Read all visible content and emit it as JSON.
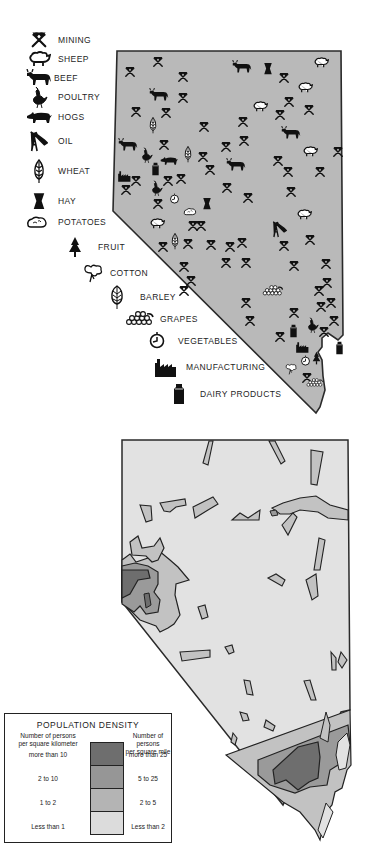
{
  "products_map": {
    "fill_color": "#b9b9b9",
    "legend": [
      {
        "icon": "mining-icon",
        "label": "MINING"
      },
      {
        "icon": "sheep-icon",
        "label": "SHEEP"
      },
      {
        "icon": "beef-icon",
        "label": "BEEF"
      },
      {
        "icon": "poultry-icon",
        "label": "POULTRY"
      },
      {
        "icon": "hogs-icon",
        "label": "HOGS"
      },
      {
        "icon": "oil-icon",
        "label": "OIL"
      },
      {
        "icon": "wheat-icon",
        "label": "WHEAT"
      },
      {
        "icon": "hay-icon",
        "label": "HAY"
      },
      {
        "icon": "potatoes-icon",
        "label": "POTATOES"
      },
      {
        "icon": "fruit-icon",
        "label": "FRUIT"
      },
      {
        "icon": "cotton-icon",
        "label": "COTTON"
      },
      {
        "icon": "barley-icon",
        "label": "BARLEY"
      },
      {
        "icon": "grapes-icon",
        "label": "GRAPES"
      },
      {
        "icon": "vegetables-icon",
        "label": "VEGETABLES"
      },
      {
        "icon": "manufacturing-icon",
        "label": "MANUFACTURING"
      },
      {
        "icon": "dairy-icon",
        "label": "DAIRY PRODUCTS"
      }
    ]
  },
  "population_map": {
    "legend": {
      "title": "POPULATION DENSITY",
      "left_header_line1": "Number of persons",
      "left_header_line2": "per square kilometer",
      "right_header_line1": "Number of persons",
      "right_header_line2": "per square mile",
      "classes": [
        {
          "km": "more than 10",
          "mile": "more than 25",
          "color": "#6e6e6e"
        },
        {
          "km": "2 to 10",
          "mile": "5 to 25",
          "color": "#969696"
        },
        {
          "km": "1 to 2",
          "mile": "2 to 5",
          "color": "#b4b4b4"
        },
        {
          "km": "Less than 1",
          "mile": "Less than 2",
          "color": "#dcdcdc"
        }
      ]
    }
  }
}
